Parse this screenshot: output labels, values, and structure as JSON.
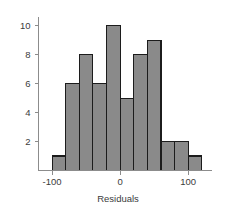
{
  "chart_data": {
    "type": "bar",
    "title": "",
    "subtitle": "",
    "xlabel": "Residuals",
    "ylabel": "",
    "orientation": "vertical",
    "histogram": true,
    "bin_width": 20,
    "bin_edges": [
      -100,
      -80,
      -60,
      -40,
      -20,
      0,
      20,
      40,
      60,
      80,
      100,
      120
    ],
    "categories": [
      "-100 to -80",
      "-80 to -60",
      "-60 to -40",
      "-40 to -20",
      "-20 to 0",
      "0 to 20",
      "20 to 40",
      "40 to 60",
      "60 to 80",
      "80 to 100",
      "100 to 120"
    ],
    "bin_centers": [
      -90,
      -70,
      -50,
      -30,
      -10,
      10,
      30,
      50,
      70,
      90,
      110
    ],
    "values": [
      1,
      6,
      8,
      6,
      10,
      5,
      8,
      9,
      2,
      2,
      1
    ],
    "total_count": 58,
    "xlim": [
      -120,
      135
    ],
    "ylim": [
      0,
      10.6
    ],
    "xticks": [
      -100,
      0,
      100
    ],
    "xtick_labels": [
      "-100",
      "0",
      "100"
    ],
    "yticks": [
      2,
      4,
      6,
      8,
      10
    ],
    "ytick_labels": [
      "2",
      "4",
      "6",
      "8",
      "10"
    ],
    "grid": false,
    "legend": null,
    "colors": {
      "bar_fill": "#8a8a8a",
      "bar_edge": "#1c1c1c",
      "axis": "#8c8c8c",
      "text": "#3b3b3b",
      "background": "#ffffff"
    }
  },
  "axis_titles": {
    "x": "Residuals"
  }
}
